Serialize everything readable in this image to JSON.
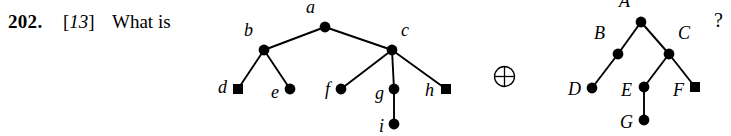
{
  "problem": {
    "number": "202.",
    "difficulty_open": "[",
    "difficulty": "13",
    "difficulty_close": "]",
    "prompt": "What is",
    "trailing": "?"
  },
  "operator": {
    "name": "circled-plus",
    "glyph": "⊕"
  },
  "colors": {
    "ink": "#000000",
    "paper": "#ffffff"
  },
  "figures": [
    {
      "id": "tree-left",
      "name": "lowercase-tree",
      "nodes": [
        {
          "id": "a",
          "label": "a",
          "x": 325,
          "y": 27,
          "shape": "disc",
          "label_dx": -19,
          "label_dy": -20
        },
        {
          "id": "b",
          "label": "b",
          "x": 264,
          "y": 50,
          "shape": "disc",
          "label_dx": -20,
          "label_dy": -20
        },
        {
          "id": "c",
          "label": "c",
          "x": 392,
          "y": 50,
          "shape": "disc",
          "label_dx": 9,
          "label_dy": -20
        },
        {
          "id": "d",
          "label": "d",
          "x": 238,
          "y": 89,
          "shape": "square",
          "label_dx": -20,
          "label_dy": -2
        },
        {
          "id": "e",
          "label": "e",
          "x": 290,
          "y": 89,
          "shape": "disc",
          "label_dx": -19,
          "label_dy": 3
        },
        {
          "id": "f",
          "label": "f",
          "x": 341,
          "y": 89,
          "shape": "disc",
          "label_dx": -16,
          "label_dy": 0
        },
        {
          "id": "g",
          "label": "g",
          "x": 394,
          "y": 89,
          "shape": "disc",
          "label_dx": -19,
          "label_dy": 4
        },
        {
          "id": "h",
          "label": "h",
          "x": 446,
          "y": 89,
          "shape": "square",
          "label_dx": -21,
          "label_dy": 1
        },
        {
          "id": "i",
          "label": "i",
          "x": 394,
          "y": 124,
          "shape": "disc",
          "label_dx": -15,
          "label_dy": 2
        }
      ],
      "edges": [
        [
          "a",
          "b"
        ],
        [
          "a",
          "c"
        ],
        [
          "b",
          "d"
        ],
        [
          "b",
          "e"
        ],
        [
          "c",
          "f"
        ],
        [
          "c",
          "g"
        ],
        [
          "c",
          "h"
        ],
        [
          "g",
          "i"
        ]
      ]
    },
    {
      "id": "tree-right",
      "name": "uppercase-tree",
      "nodes": [
        {
          "id": "A",
          "label": "A",
          "x": 641,
          "y": 22,
          "shape": "disc",
          "label_dx": -22,
          "label_dy": -21
        },
        {
          "id": "B",
          "label": "B",
          "x": 618,
          "y": 54,
          "shape": "disc",
          "label_dx": -24,
          "label_dy": -21
        },
        {
          "id": "C",
          "label": "C",
          "x": 669,
          "y": 54,
          "shape": "disc",
          "label_dx": 9,
          "label_dy": -21
        },
        {
          "id": "D",
          "label": "D",
          "x": 592,
          "y": 88,
          "shape": "disc",
          "label_dx": -24,
          "label_dy": 1
        },
        {
          "id": "E",
          "label": "E",
          "x": 644,
          "y": 87,
          "shape": "disc",
          "label_dx": -23,
          "label_dy": 3
        },
        {
          "id": "F",
          "label": "F",
          "x": 695,
          "y": 87,
          "shape": "square",
          "label_dx": -22,
          "label_dy": 3
        },
        {
          "id": "G",
          "label": "G",
          "x": 644,
          "y": 120,
          "shape": "disc",
          "label_dx": -24,
          "label_dy": 2
        }
      ],
      "edges": [
        [
          "A",
          "B"
        ],
        [
          "A",
          "C"
        ],
        [
          "B",
          "D"
        ],
        [
          "C",
          "E"
        ],
        [
          "C",
          "F"
        ],
        [
          "E",
          "G"
        ]
      ]
    }
  ]
}
